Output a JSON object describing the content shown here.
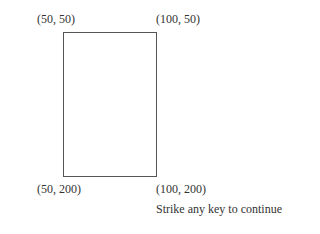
{
  "labels": {
    "top_left": "(50, 50)",
    "top_right": "(100, 50)",
    "bottom_left": "(50, 200)",
    "bottom_right": "(100, 200)"
  },
  "prompt": "Strike any key to continue",
  "rectangle": {
    "x1": 50,
    "y1": 50,
    "x2": 100,
    "y2": 200,
    "stroke": "#555555"
  }
}
